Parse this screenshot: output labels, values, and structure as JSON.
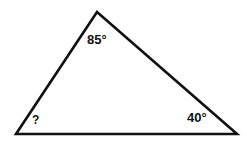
{
  "figure": {
    "type": "geometry-diagram",
    "shape": "triangle",
    "background_color": "#ffffff",
    "stroke_color": "#111111",
    "stroke_width": 2.6,
    "vertices": {
      "apex": {
        "x": 97,
        "y": 12
      },
      "bottom_left": {
        "x": 16,
        "y": 134
      },
      "bottom_right": {
        "x": 237,
        "y": 134
      }
    },
    "labels": {
      "apex_angle": "85°",
      "bottom_right_angle": "40°",
      "bottom_left_angle": "?"
    }
  },
  "chart_data": {
    "type": "table",
    "categories": [
      "Apex (top)",
      "Bottom right",
      "Bottom left"
    ],
    "values": [
      85,
      40,
      null
    ],
    "labels": [
      "85°",
      "40°",
      "?"
    ],
    "ylabel": "Degrees",
    "xlabel": "Vertex"
  }
}
